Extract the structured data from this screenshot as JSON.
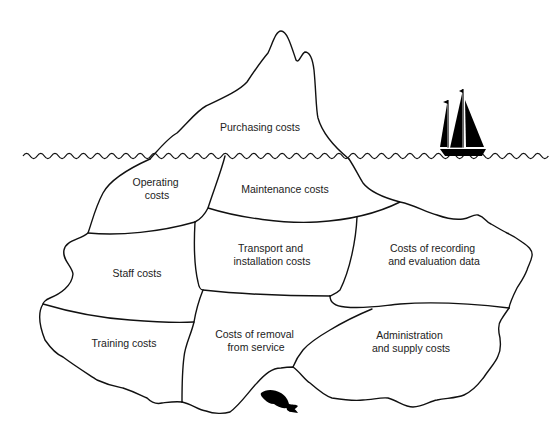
{
  "diagram": {
    "colors": {
      "line": "#111111",
      "text": "#222222",
      "background": "#ffffff",
      "silhouette": "#000000"
    },
    "above_water": {
      "label": "Purchasing costs"
    },
    "below_water": [
      {
        "id": "operating",
        "lines": [
          "Operating",
          "costs"
        ]
      },
      {
        "id": "maintenance",
        "lines": [
          "Maintenance costs"
        ]
      },
      {
        "id": "staff",
        "lines": [
          "Staff costs"
        ]
      },
      {
        "id": "transport",
        "lines": [
          "Transport and",
          "installation costs"
        ]
      },
      {
        "id": "recording",
        "lines": [
          "Costs of recording",
          "and evaluation data"
        ]
      },
      {
        "id": "training",
        "lines": [
          "Training costs"
        ]
      },
      {
        "id": "removal",
        "lines": [
          "Costs of removal",
          "from service"
        ]
      },
      {
        "id": "administration",
        "lines": [
          "Administration",
          "and supply costs"
        ]
      }
    ],
    "icons": {
      "ship": "sailing-ship-icon",
      "fish": "fish-icon",
      "water": "wavy-waterline"
    }
  }
}
